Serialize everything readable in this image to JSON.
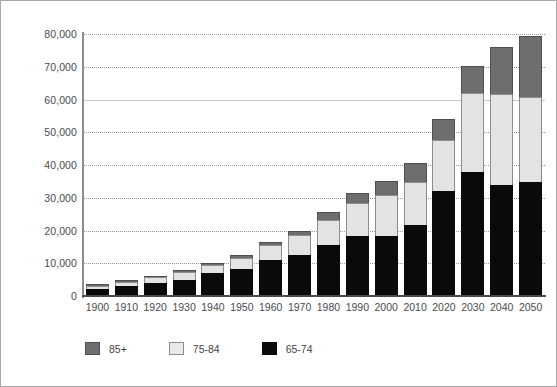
{
  "chart_data": {
    "type": "bar",
    "stacked": true,
    "title": "",
    "xlabel": "",
    "ylabel": "",
    "ylim": [
      0,
      80000
    ],
    "ytick_step": 10000,
    "ytick_labels": [
      "80,000",
      "70,000",
      "60,000",
      "50,000",
      "40,000",
      "30,000",
      "20,000",
      "10,000",
      "0"
    ],
    "ytick_values": [
      80000,
      70000,
      60000,
      50000,
      40000,
      30000,
      20000,
      10000,
      0
    ],
    "grid": true,
    "legend_position": "bottom-left",
    "categories": [
      "1900",
      "1910",
      "1920",
      "1930",
      "1940",
      "1950",
      "1960",
      "1970",
      "1980",
      "1990",
      "2000",
      "2010",
      "2020",
      "2030",
      "2040",
      "2050"
    ],
    "series": [
      {
        "name": "65-74",
        "color": "#0a0a0a",
        "values": [
          2200,
          3000,
          4000,
          5000,
          6900,
          8400,
          11000,
          12400,
          15600,
          18400,
          18400,
          21700,
          32000,
          38000,
          34000,
          34800
        ]
      },
      {
        "name": "75-84",
        "color": "#e3e3e3",
        "values": [
          1000,
          1300,
          1700,
          2200,
          2600,
          3300,
          4600,
          6100,
          7700,
          10100,
          12400,
          13100,
          15500,
          24000,
          27700,
          26000
        ]
      },
      {
        "name": "85+",
        "color": "#6e6e6e",
        "values": [
          400,
          500,
          500,
          600,
          700,
          900,
          1000,
          1500,
          2300,
          3100,
          4300,
          5800,
          6700,
          8300,
          14300,
          18500
        ]
      }
    ],
    "totals": [
      3600,
      4800,
      6200,
      7800,
      10200,
      12600,
      16600,
      20000,
      25600,
      31600,
      35100,
      40600,
      54200,
      70300,
      76000,
      79300
    ]
  },
  "legend": {
    "items": [
      {
        "label": "85+",
        "swatch": "swatch-dark-gray"
      },
      {
        "label": "75-84",
        "swatch": "swatch-light-gray"
      },
      {
        "label": "65-74",
        "swatch": "swatch-black"
      }
    ]
  }
}
